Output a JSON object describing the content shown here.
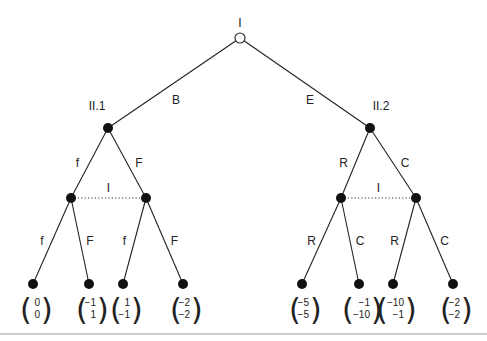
{
  "diagram": {
    "type": "extensive-form-game-tree",
    "root": {
      "player": "I",
      "actions": [
        "B",
        "E"
      ]
    },
    "subtrees": [
      {
        "node_label": "II.1",
        "first_actions": [
          "f",
          "F"
        ],
        "info_set_label": "I",
        "second_actions": [
          [
            "f",
            "F"
          ],
          [
            "f",
            "F"
          ]
        ],
        "payoffs": [
          [
            "0",
            "0"
          ],
          [
            "−1",
            "1"
          ],
          [
            "1",
            "−1"
          ],
          [
            "−2",
            "−2"
          ]
        ]
      },
      {
        "node_label": "II.2",
        "first_actions": [
          "R",
          "C"
        ],
        "info_set_label": "I",
        "second_actions": [
          [
            "R",
            "C"
          ],
          [
            "R",
            "C"
          ]
        ],
        "payoffs": [
          [
            "−5",
            "−5"
          ],
          [
            "−1",
            "−10"
          ],
          [
            "−10",
            "−1"
          ],
          [
            "−2",
            "−2"
          ]
        ]
      }
    ]
  }
}
